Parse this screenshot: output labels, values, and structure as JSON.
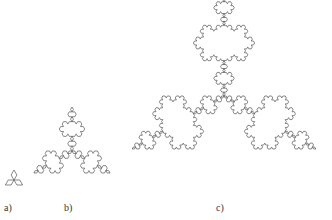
{
  "figures": [
    {
      "id": "a",
      "label": "a)",
      "iterations": 1,
      "cx": 14,
      "cy": 180,
      "radius": 10,
      "label_x": 4,
      "label_y": 202
    },
    {
      "id": "b",
      "label": "b)",
      "iterations": 3,
      "cx": 72,
      "cy": 151,
      "radius": 44,
      "label_x": 64,
      "label_y": 202
    },
    {
      "id": "c",
      "label": "c)",
      "iterations": 4,
      "cx": 224,
      "cy": 96,
      "radius": 106,
      "label_x": 216,
      "label_y": 202
    }
  ],
  "stroke_color": "#555555",
  "fractal": "Koch anti-snowflake"
}
